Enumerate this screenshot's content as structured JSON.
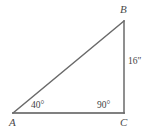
{
  "figure": {
    "type": "right-triangle-diagram",
    "background_color": "#ffffff",
    "stroke_color_base": "#808080",
    "stroke_color_sides": "#6a6a6a",
    "label_color": "#4a4a4a",
    "measure_color": "#3f3f3f",
    "vertices": {
      "a": {
        "label": "A",
        "x": 13,
        "y": 113
      },
      "b": {
        "label": "B",
        "x": 124,
        "y": 21
      },
      "c": {
        "label": "C",
        "x": 124,
        "y": 113
      }
    },
    "angles": {
      "at_a": "40°",
      "at_c": "90°"
    },
    "sides": {
      "bc_length": "16″"
    }
  }
}
